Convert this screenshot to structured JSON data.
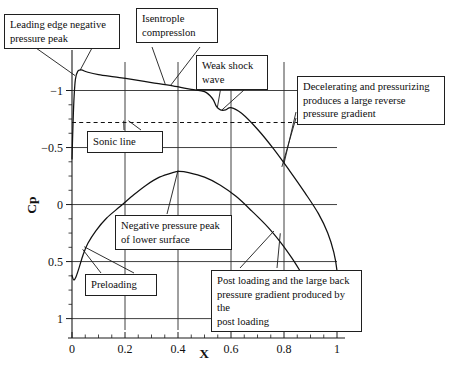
{
  "figure": {
    "kind": "pressure-coefficient-distribution",
    "background": "#ffffff",
    "line_color": "#111111"
  },
  "chart_data": {
    "type": "line",
    "title": "",
    "xlabel": "X",
    "ylabel": "Cp",
    "xlim": [
      0,
      1
    ],
    "ylim": [
      -1.25,
      1.1
    ],
    "y_inverted": true,
    "grid": true,
    "legend": "none",
    "xticks": [
      0,
      0.2,
      0.4,
      0.6,
      0.8,
      1
    ],
    "xtick_labels": [
      "0",
      "0.2",
      "0.4",
      "0.6",
      "0.8",
      "1"
    ],
    "x_minor_ticks": [
      0.05,
      0.1,
      0.15,
      0.25,
      0.3,
      0.35,
      0.45,
      0.5,
      0.55,
      0.65,
      0.7,
      0.75,
      0.85,
      0.9,
      0.95
    ],
    "yticks": [
      -1,
      -0.5,
      0,
      0.5,
      1
    ],
    "ytick_labels": [
      "−1",
      "−0.5",
      "0",
      "0.5",
      "1"
    ],
    "y_minor_ticks": [
      -0.875,
      -0.75,
      -0.625,
      -0.375,
      -0.25,
      -0.125,
      0.125,
      0.25,
      0.375,
      0.625,
      0.75,
      0.875
    ],
    "series": [
      {
        "name": "upper-surface",
        "points": [
          [
            0.0,
            -0.4
          ],
          [
            0.004,
            -0.72
          ],
          [
            0.008,
            -0.95
          ],
          [
            0.013,
            -1.1
          ],
          [
            0.022,
            -1.17
          ],
          [
            0.035,
            -1.18
          ],
          [
            0.06,
            -1.16
          ],
          [
            0.1,
            -1.14
          ],
          [
            0.16,
            -1.12
          ],
          [
            0.22,
            -1.1
          ],
          [
            0.3,
            -1.07
          ],
          [
            0.38,
            -1.04
          ],
          [
            0.45,
            -1.01
          ],
          [
            0.5,
            -0.99
          ],
          [
            0.53,
            -0.93
          ],
          [
            0.545,
            -0.86
          ],
          [
            0.56,
            -0.83
          ],
          [
            0.58,
            -0.83
          ],
          [
            0.6,
            -0.85
          ],
          [
            0.64,
            -0.8
          ],
          [
            0.7,
            -0.66
          ],
          [
            0.76,
            -0.49
          ],
          [
            0.82,
            -0.3
          ],
          [
            0.88,
            -0.1
          ],
          [
            0.93,
            0.08
          ],
          [
            0.965,
            0.25
          ],
          [
            0.988,
            0.42
          ],
          [
            1.0,
            0.58
          ],
          [
            1.003,
            0.72
          ],
          [
            0.992,
            0.82
          ],
          [
            0.968,
            0.86
          ],
          [
            0.935,
            0.84
          ],
          [
            0.9,
            0.78
          ],
          [
            0.86,
            0.7
          ]
        ]
      },
      {
        "name": "lower-surface",
        "points": [
          [
            0.0,
            0.62
          ],
          [
            0.006,
            0.66
          ],
          [
            0.014,
            0.64
          ],
          [
            0.026,
            0.56
          ],
          [
            0.042,
            0.44
          ],
          [
            0.06,
            0.34
          ],
          [
            0.09,
            0.23
          ],
          [
            0.13,
            0.12
          ],
          [
            0.18,
            0.02
          ],
          [
            0.23,
            -0.08
          ],
          [
            0.28,
            -0.17
          ],
          [
            0.33,
            -0.24
          ],
          [
            0.38,
            -0.28
          ],
          [
            0.405,
            -0.29
          ],
          [
            0.44,
            -0.28
          ],
          [
            0.5,
            -0.24
          ],
          [
            0.56,
            -0.17
          ],
          [
            0.62,
            -0.07
          ],
          [
            0.68,
            0.06
          ],
          [
            0.74,
            0.2
          ],
          [
            0.79,
            0.34
          ],
          [
            0.83,
            0.47
          ],
          [
            0.86,
            0.58
          ],
          [
            0.88,
            0.66
          ]
        ]
      }
    ],
    "reference_lines": [
      {
        "name": "sonic-line",
        "orientation": "horizontal",
        "value": -0.72,
        "style": "dashed",
        "label": "Sonic line"
      }
    ],
    "annotations": [
      {
        "id": "leading-edge-negative-pressure-peak",
        "text": "Leading edge negative\npressure peak",
        "points_to": [
          0.03,
          -1.17
        ]
      },
      {
        "id": "isentropic-compression",
        "text": "Isentrople\ncompresslon",
        "points_to": [
          0.36,
          -1.05
        ]
      },
      {
        "id": "weak-shock-wave",
        "text": "Weak shock\nwave",
        "points_to": [
          0.56,
          -0.84
        ]
      },
      {
        "id": "decelerating-and-pressurizing",
        "text": "Decelerating and pressurizing\nproduces a large reverse\npressure gradient",
        "points_to": [
          0.8,
          -0.36
        ]
      },
      {
        "id": "sonic-line",
        "text": "Sonic line",
        "points_to": [
          0.23,
          -0.72
        ]
      },
      {
        "id": "negative-pressure-peak-of-lower-surface",
        "text": "Negative pressure peak\nof lower surface",
        "points_to": [
          0.4,
          -0.29
        ]
      },
      {
        "id": "preloading",
        "text": "Preloading",
        "points_to": [
          0.05,
          0.38
        ]
      },
      {
        "id": "post-loading-back-pressure-gradient",
        "text": "Post loading and the large back\npressure gradient produced by the\npost loading",
        "points_to": [
          0.76,
          0.26
        ]
      }
    ]
  },
  "axes": {
    "x_title": "X",
    "y_title": "Cp"
  }
}
